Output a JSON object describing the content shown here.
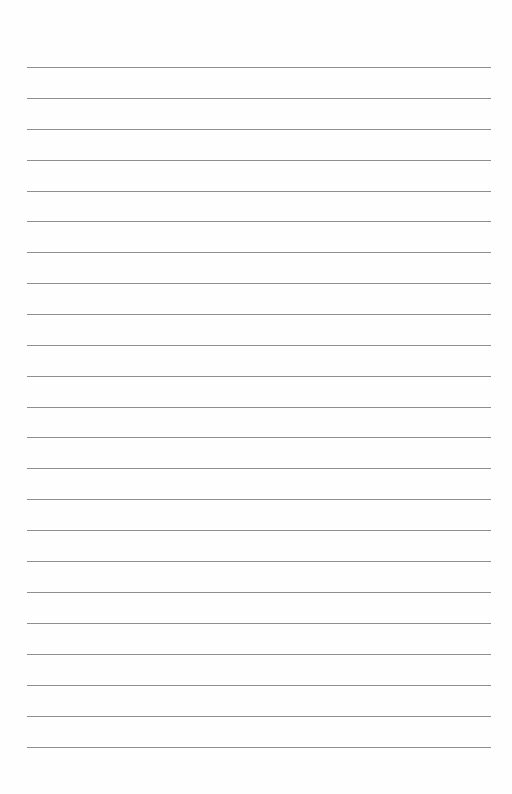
{
  "page": {
    "type": "lined-paper",
    "background": "#fefefe",
    "line_color": "#8f8f8f",
    "line_left": 27,
    "line_width": 464,
    "line_count": 23,
    "line_positions": [
      67,
      98,
      129,
      160,
      191,
      221,
      252,
      283,
      314,
      345,
      376,
      407,
      437,
      468,
      499,
      530,
      561,
      592,
      623,
      654,
      685,
      716,
      747
    ]
  }
}
